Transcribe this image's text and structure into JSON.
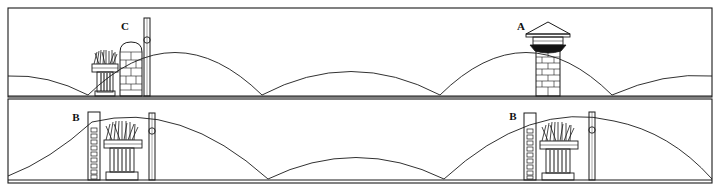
{
  "figure": {
    "style": "patent-line-drawing",
    "background_color": "#ffffff",
    "line_color": "#1a1a1a",
    "width": 720,
    "height": 189
  },
  "panels": [
    {
      "id": "panel-top",
      "name": "upper-elevation",
      "frame": {
        "x": 8,
        "y": 8,
        "width": 704,
        "height": 89
      },
      "ground_y": 96,
      "arcs": [
        {
          "name": "arc-left-partial",
          "x1": 8,
          "x2": 88,
          "peak_dy": 20
        },
        {
          "name": "arc-second",
          "x1": 88,
          "x2": 262,
          "peak_dy": 62
        },
        {
          "name": "arc-third",
          "x1": 262,
          "x2": 440,
          "peak_dy": 30
        },
        {
          "name": "arc-fourth",
          "x1": 440,
          "x2": 612,
          "peak_dy": 62
        },
        {
          "name": "arc-right-partial",
          "x1": 612,
          "x2": 712,
          "peak_dy": 22
        }
      ],
      "labels": [
        {
          "text": "C",
          "x": 125,
          "y": 30
        },
        {
          "text": "A",
          "x": 521,
          "y": 30
        }
      ],
      "elements": [
        {
          "type": "brush-assembly",
          "name": "chimney-brush-c",
          "x": 92,
          "y": 52,
          "width": 26,
          "height": 44
        },
        {
          "type": "brick-stack",
          "name": "brick-pier-c",
          "x": 120,
          "y": 42,
          "width": 22,
          "height": 54,
          "top": "rounded",
          "courses": 6
        },
        {
          "type": "pole",
          "name": "vertical-pole-c",
          "x": 145,
          "y": 18,
          "height": 78,
          "ring_y": 40
        },
        {
          "type": "brick-stack",
          "name": "brick-chimney-a",
          "x": 536,
          "y": 40,
          "width": 24,
          "height": 56,
          "top": "capped",
          "courses": 7
        },
        {
          "type": "chimney-cap",
          "name": "chimney-cap-a",
          "x": 526,
          "y": 22,
          "width": 44,
          "height": 20
        }
      ]
    },
    {
      "id": "panel-bottom",
      "name": "lower-elevation",
      "frame": {
        "x": 8,
        "y": 99,
        "width": 704,
        "height": 84
      },
      "ground_y": 180,
      "arcs": [
        {
          "name": "arc-left-rise",
          "x1": 8,
          "x2": 92,
          "peak_dy": 58
        },
        {
          "name": "arc-second",
          "x1": 92,
          "x2": 268,
          "peak_dy": 62
        },
        {
          "name": "arc-third",
          "x1": 268,
          "x2": 444,
          "peak_dy": 32
        },
        {
          "name": "arc-fourth",
          "x1": 444,
          "x2": 614,
          "peak_dy": 62
        },
        {
          "name": "arc-right-partial",
          "x1": 614,
          "x2": 712,
          "peak_dy": 40
        }
      ],
      "labels": [
        {
          "text": "B",
          "x": 76,
          "y": 121
        },
        {
          "text": "B",
          "x": 513,
          "y": 120
        }
      ],
      "elements": [
        {
          "type": "ladder",
          "name": "ladder-left",
          "x": 88,
          "y": 112,
          "width": 12,
          "height": 68,
          "rungs": 11
        },
        {
          "type": "brush-assembly",
          "name": "chimney-brush-b1",
          "x": 104,
          "y": 122,
          "width": 38,
          "height": 58
        },
        {
          "type": "pole",
          "name": "vertical-pole-b1",
          "x": 150,
          "y": 113,
          "height": 67,
          "ring_y": 131
        },
        {
          "type": "ladder",
          "name": "ladder-right",
          "x": 524,
          "y": 113,
          "width": 12,
          "height": 67,
          "rungs": 11
        },
        {
          "type": "brush-assembly",
          "name": "chimney-brush-b2",
          "x": 540,
          "y": 123,
          "width": 38,
          "height": 57
        },
        {
          "type": "pole",
          "name": "vertical-pole-b2",
          "x": 590,
          "y": 112,
          "height": 68,
          "ring_y": 130
        }
      ]
    }
  ]
}
